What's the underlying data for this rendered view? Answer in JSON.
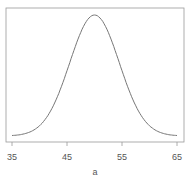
{
  "chart_data": {
    "type": "line",
    "title": "",
    "xlabel": "a",
    "ylabel": "",
    "xlim": [
      34,
      66
    ],
    "x_ticks": [
      35,
      45,
      55,
      65
    ],
    "x_tick_labels": [
      "35",
      "45",
      "55",
      "65"
    ],
    "grid": false,
    "legend": null,
    "series": [
      {
        "name": "density",
        "description": "Normal density curve, mean ~50, sd ~4.5",
        "x": [
          35,
          37,
          39,
          41,
          43,
          45,
          47,
          49,
          50,
          51,
          53,
          55,
          57,
          59,
          61,
          63,
          65
        ],
        "y_relative": [
          0.004,
          0.015,
          0.05,
          0.135,
          0.3,
          0.54,
          0.8,
          0.976,
          1.0,
          0.976,
          0.8,
          0.54,
          0.3,
          0.135,
          0.05,
          0.015,
          0.004
        ]
      }
    ],
    "colors": {
      "line": "#777777",
      "axis": "#999999"
    }
  },
  "labels": {
    "xlabel": "a",
    "ticks": [
      "35",
      "45",
      "55",
      "65"
    ]
  }
}
